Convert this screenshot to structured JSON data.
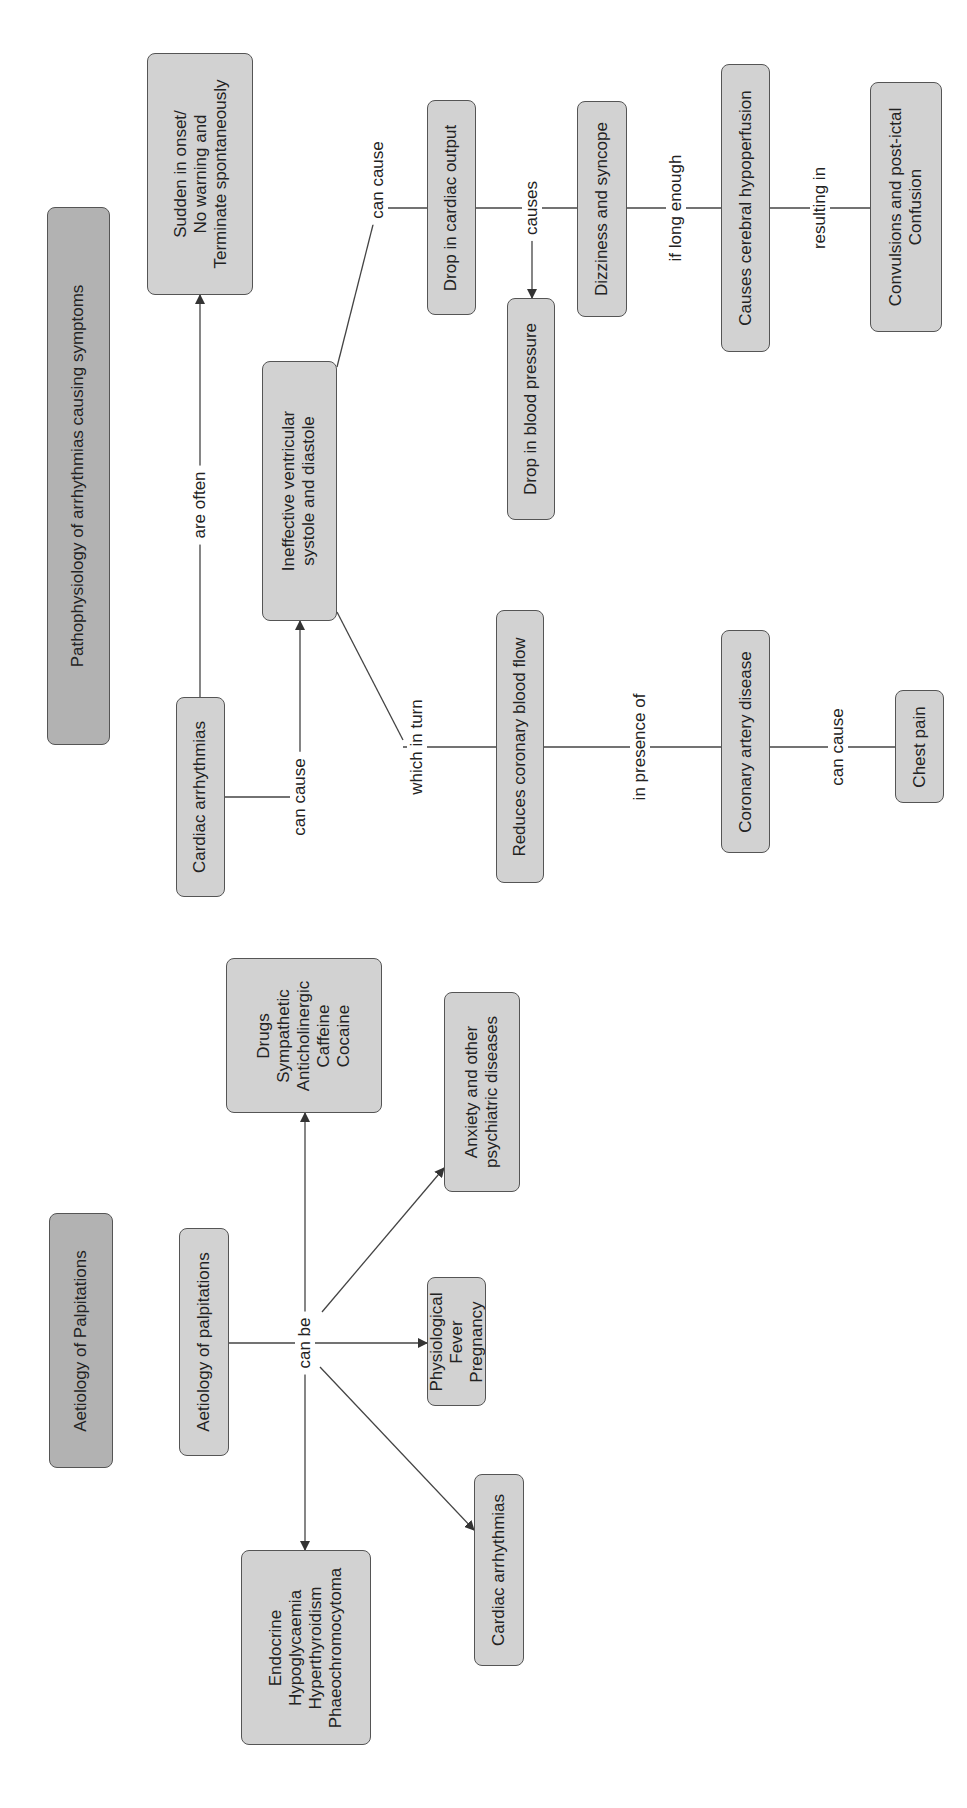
{
  "diagram_top": {
    "title": "Pathophysiology of arrhythmias causing symptoms",
    "nodes": {
      "sudden": "Sudden in onset/\nNo warning and\nTerminate spontaneously",
      "cardiac_arrhythmias": "Cardiac arrhythmias",
      "ineffective": "Ineffective ventricular\nsystole and diastole",
      "drop_cardiac_output": "Drop in cardiac output",
      "drop_blood_pressure": "Drop in blood pressure",
      "dizziness": "Dizziness and syncope",
      "cerebral_hypoperfusion": "Causes cerebral hypoperfusion",
      "convulsions": "Convulsions and post-ictal\nConfusion",
      "reduces_coronary": "Reduces coronary blood flow",
      "coronary_artery_disease": "Coronary artery disease",
      "chest_pain": "Chest pain"
    },
    "links": {
      "are_often": "are often",
      "can_cause_1": "can cause",
      "can_cause_2": "can cause",
      "causes": "causes",
      "if_long_enough": "if long enough",
      "resulting_in": "resulting in",
      "which_in_turn": "which in turn",
      "in_presence_of": "in presence of",
      "can_cause_3": "can cause"
    }
  },
  "diagram_bottom": {
    "title": "Aetiology of Palpitations",
    "nodes": {
      "aetiology": "Aetiology of palpitations",
      "drugs": "Drugs\nSympathetic\nAnticholinergic\nCaffeine\nCocaine",
      "anxiety": "Anxiety and other\npsychiatric diseases",
      "physiological": "Physiological\nFever\nPregnancy",
      "cardiac_arrhythmias": "Cardiac arrhythmias",
      "endocrine": "Endocrine\nHypoglycaemia\nHyperthyroidism\nPhaeochromocytoma"
    },
    "links": {
      "can_be": "can be"
    }
  },
  "colors": {
    "node_fill": "#d2d2d2",
    "title_fill": "#b2b2b2",
    "border": "#555555",
    "line": "#444444"
  }
}
